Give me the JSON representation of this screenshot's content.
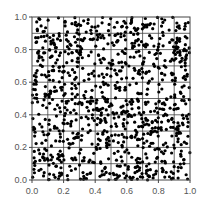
{
  "chart_data": {
    "type": "scatter",
    "title": "",
    "xlabel": "",
    "ylabel": "",
    "xlim": [
      0.0,
      1.0
    ],
    "ylim": [
      0.0,
      1.0
    ],
    "grid": true,
    "grid_step": 0.1,
    "legend": null,
    "xticks": [
      "0.0",
      "0.2",
      "0.4",
      "0.6",
      "0.8",
      "1.0"
    ],
    "yticks": [
      "0.0",
      "0.2",
      "0.4",
      "0.6",
      "0.8",
      "1.0"
    ],
    "marker_color": "#000000",
    "marker_size": 1.6,
    "n_points_approx": 1000,
    "distribution": "uniform random on [0,1]x[0,1]",
    "seed": 12345,
    "series": [
      {
        "name": "points",
        "x": [
          0.03,
          0.07,
          0.12,
          0.18,
          0.22,
          0.27,
          0.33,
          0.38,
          0.41,
          0.47,
          0.52,
          0.58,
          0.63,
          0.67,
          0.72,
          0.78,
          0.83,
          0.87,
          0.92,
          0.97,
          0.05,
          0.15,
          0.25,
          0.35,
          0.45,
          0.55,
          0.65,
          0.75,
          0.85,
          0.95
        ],
        "y": [
          0.97,
          0.91,
          0.85,
          0.78,
          0.72,
          0.66,
          0.61,
          0.55,
          0.49,
          0.43,
          0.38,
          0.33,
          0.27,
          0.21,
          0.16,
          0.11,
          0.06,
          0.02,
          0.94,
          0.88,
          0.12,
          0.24,
          0.36,
          0.48,
          0.6,
          0.72,
          0.84,
          0.96,
          0.31,
          0.57
        ]
      }
    ]
  },
  "plot_area": {
    "left": 32,
    "top": 17,
    "right": 190,
    "bottom": 180
  },
  "colors": {
    "grid": "#444444",
    "axis": "#444444",
    "marker": "#000000",
    "text": "#555555"
  }
}
